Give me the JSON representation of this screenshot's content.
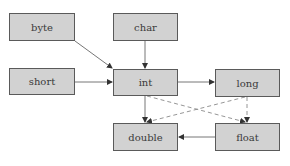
{
  "diagram": {
    "type": "type-conversion-graph",
    "colors": {
      "node_fill": "#d2d2d2",
      "node_border": "#5a5a5a",
      "edge": "#555555",
      "dashed_edge": "#8a8a8a"
    },
    "nodes": [
      {
        "id": "byte",
        "label": "byte",
        "x": 9,
        "y": 13,
        "w": 66,
        "h": 28
      },
      {
        "id": "char",
        "label": "char",
        "x": 113,
        "y": 13,
        "w": 65,
        "h": 28
      },
      {
        "id": "short",
        "label": "short",
        "x": 9,
        "y": 68,
        "w": 66,
        "h": 27
      },
      {
        "id": "int",
        "label": "int",
        "x": 113,
        "y": 69,
        "w": 65,
        "h": 27
      },
      {
        "id": "long",
        "label": "long",
        "x": 215,
        "y": 69,
        "w": 65,
        "h": 28
      },
      {
        "id": "double",
        "label": "double",
        "x": 113,
        "y": 123,
        "w": 65,
        "h": 28
      },
      {
        "id": "float",
        "label": "float",
        "x": 215,
        "y": 123,
        "w": 65,
        "h": 28
      }
    ],
    "edges": [
      {
        "from": "byte",
        "to": "int",
        "style": "solid"
      },
      {
        "from": "char",
        "to": "int",
        "style": "solid"
      },
      {
        "from": "short",
        "to": "int",
        "style": "solid"
      },
      {
        "from": "int",
        "to": "long",
        "style": "solid"
      },
      {
        "from": "int",
        "to": "double",
        "style": "solid"
      },
      {
        "from": "int",
        "to": "float",
        "style": "dashed"
      },
      {
        "from": "long",
        "to": "double",
        "style": "dashed"
      },
      {
        "from": "long",
        "to": "float",
        "style": "dashed"
      },
      {
        "from": "float",
        "to": "double",
        "style": "solid"
      }
    ]
  }
}
